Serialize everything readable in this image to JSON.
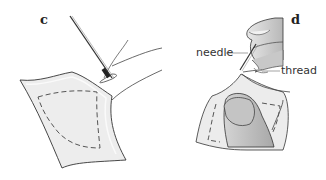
{
  "panels": [
    {
      "id": "c",
      "label": "c"
    },
    {
      "id": "d",
      "label": "d"
    }
  ],
  "callouts": {
    "needle": "needle",
    "thread": "thread"
  },
  "colors": {
    "outline": "#333333",
    "tissue_fill": "#ececec",
    "tissue_inner": "#e4e4e4",
    "finger_fill": "#bdbdbd",
    "finger_light": "#d9d9d9",
    "dash": "#555555"
  }
}
